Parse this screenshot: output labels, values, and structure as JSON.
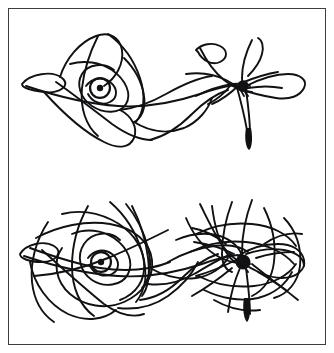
{
  "figure": {
    "title": "",
    "caption": "",
    "background_color": "#ffffff",
    "ink_color": "#111114",
    "frame": {
      "label": "figure-border",
      "color": "#3c3c42",
      "stroke_width": 1,
      "x": 8,
      "y": 8,
      "width": 318,
      "height": 337
    },
    "panels": [
      {
        "id": "upper-panel",
        "label": "upper trajectory plot",
        "iterations_note": "short orbit",
        "elliptic_center": {
          "x": 100,
          "y": 88,
          "radius": 3.2,
          "label": "elliptic fixed point (left)"
        },
        "hyperbolic_center": {
          "x": 243,
          "y": 86,
          "radius": 5.8,
          "label": "hyperbolic fixed point (right)"
        },
        "tail": {
          "x": 249,
          "y": 148,
          "label": "lower cusp tail"
        }
      },
      {
        "id": "lower-panel",
        "label": "lower trajectory plot",
        "iterations_note": "long orbit",
        "elliptic_center": {
          "x": 101,
          "y": 262,
          "radius": 3.2,
          "label": "elliptic fixed point (left)"
        },
        "hyperbolic_center": {
          "x": 243,
          "y": 262,
          "radius": 7.5,
          "label": "hyperbolic fixed point (right)"
        },
        "tail": {
          "x": 247,
          "y": 320,
          "label": "lower cusp tail"
        }
      }
    ]
  },
  "chart_data": {
    "type": "line",
    "title": "",
    "subtitle": "",
    "xlabel": "",
    "ylabel": "",
    "grid": false,
    "legend": "none",
    "axes_visible": false,
    "tick_labels_x": [],
    "tick_labels_y": [],
    "annotations": [],
    "series": [
      {
        "name": "upper-orbit",
        "panel": "upper-panel",
        "stroke": "#111114",
        "stroke_width": 1.9,
        "paths": [
          "M 22 84 C 30 74, 52 70, 62 78 C 72 86, 58 94, 44 92 C 30 90, 22 88, 22 84 Z",
          "M 26 86 C 56 96, 88 104, 118 106 C 150 108, 176 102, 200 94 C 214 89, 226 86, 236 85",
          "M 44 92 C 62 112, 84 132, 104 142 C 120 150, 130 147, 134 138 C 138 128, 132 116, 120 110",
          "M 60 77 C 66 58, 80 42, 96 36 C 110 31, 120 38, 122 50 C 124 64, 116 78, 104 86",
          "M 98 36 C 90 52, 84 70, 82 88 C 80 108, 86 126, 98 136",
          "M 108 34 C 122 44, 134 60, 140 78 C 146 96, 144 112, 136 122",
          "M 70 64 C 84 60, 100 62, 112 70 C 126 80, 132 94, 126 104 C 120 114, 104 114, 92 106 C 80 98, 76 84, 82 74 C 88 64, 104 62, 114 70",
          "M 86 86 C 92 78, 102 76, 110 82 C 118 88, 118 98, 110 102 C 102 106, 92 102, 88 94",
          "M 56 82 C 76 96, 96 112, 112 124 C 126 134, 140 140, 152 140",
          "M 124 58 C 134 68, 142 82, 144 96 C 146 108, 142 118, 134 122",
          "M 134 122 C 150 132, 168 134, 184 128 C 198 122, 208 110, 212 98",
          "M 120 110 C 136 108, 152 102, 166 94 C 182 85, 198 78, 212 76",
          "M 150 140 C 166 136, 180 126, 192 114 C 204 102, 216 94, 228 90",
          "M 196 96 C 208 90, 220 86, 232 84 C 240 83, 246 84, 250 86",
          "M 186 74 C 200 72, 214 74, 226 80 C 236 85, 242 90, 244 96",
          "M 200 48 C 206 60, 214 72, 224 80 C 234 88, 244 92, 252 92",
          "M 196 50 C 202 44, 212 42, 220 46 C 228 50, 228 58, 220 62 C 212 66, 202 60, 198 52 Z",
          "M 236 88 C 248 92, 262 96, 276 98 C 290 100, 300 96, 304 88 C 308 80, 300 74, 288 74 C 274 74, 258 80, 246 86",
          "M 252 40 C 246 52, 242 66, 242 78 C 242 86, 244 92, 248 96",
          "M 258 38 C 262 40, 264 46, 262 54 C 260 62, 254 70, 248 76",
          "M 240 84 C 232 92, 222 100, 212 104",
          "M 246 90 C 248 104, 250 120, 250 134",
          "M 236 84 C 240 98, 244 114, 247 130",
          "M 230 86 C 224 94, 216 100, 208 104",
          "M 244 82 C 254 78, 266 74, 278 72",
          "M 248 88 C 260 86, 272 86, 282 88"
        ],
        "tail_path": "M 246 128 C 244 138, 246 148, 249 150 C 252 148, 253 138, 251 128 Z"
      },
      {
        "name": "lower-orbit",
        "panel": "lower-panel",
        "stroke": "#111114",
        "stroke_width": 1.9,
        "paths": [
          "M 20 254 C 26 244, 44 240, 54 246 C 64 252, 56 262, 42 262 C 28 262, 20 258, 20 254 Z",
          "M 24 256 C 54 266, 86 274, 118 276 C 150 278, 178 272, 202 264 C 216 259, 228 256, 238 255",
          "M 36 238 C 58 226, 86 220, 110 224 C 134 228, 150 242, 152 260 C 154 278, 142 294, 124 302 C 106 310, 84 306, 70 294 C 56 282, 52 262, 62 248",
          "M 30 262 C 34 284, 48 304, 68 314 C 86 322, 104 320, 116 310",
          "M 48 222 C 36 240, 30 262, 32 282 C 34 300, 42 314, 54 322",
          "M 62 214 C 78 210, 96 212, 112 220 C 130 229, 142 244, 144 262 C 146 280, 136 294, 120 300",
          "M 88 206 C 78 224, 72 246, 72 266 C 72 288, 80 306, 94 316",
          "M 110 202 C 124 214, 136 232, 142 252 C 148 272, 146 290, 136 302",
          "M 72 234 C 86 228, 102 230, 114 238 C 128 248, 134 262, 128 274 C 122 286, 104 288, 92 280 C 80 272, 76 256, 84 244 C 92 232, 110 230, 120 240",
          "M 88 258 C 94 250, 104 248, 112 254 C 120 260, 120 270, 112 274 C 104 278, 94 274, 90 266",
          "M 42 250 C 62 268, 84 288, 104 304 C 118 314, 132 318, 144 314",
          "M 126 204 C 136 216, 144 232, 148 248 C 152 264, 150 278, 142 288",
          "M 132 206 C 140 222, 146 240, 148 258 C 150 274, 148 288, 142 296",
          "M 30 248 C 52 256, 76 264, 100 268 C 126 272, 150 270, 170 262",
          "M 34 276 C 58 274, 84 268, 108 258 C 132 248, 152 238, 168 230",
          "M 140 300 C 156 298, 170 290, 182 278 C 194 266, 206 258, 218 254",
          "M 118 308 C 136 310, 154 306, 168 296 C 182 286, 192 274, 198 262",
          "M 150 268 C 164 276, 180 280, 196 278 C 210 276, 222 268, 228 258",
          "M 148 284 C 164 286, 180 282, 194 274 C 208 266, 220 258, 232 254",
          "M 168 262 C 182 254, 198 248, 214 246 C 228 244, 240 246, 248 252",
          "M 176 240 C 190 234, 206 232, 220 236 C 232 240, 240 248, 242 256",
          "M 186 218 C 192 232, 202 246, 214 254 C 226 262, 238 264, 248 262",
          "M 200 204 C 208 220, 216 238, 226 250 C 234 260, 242 264, 250 264",
          "M 212 206 C 214 222, 218 240, 226 252 C 232 262, 240 266, 248 266",
          "M 232 202 C 226 218, 222 238, 222 254 C 222 264, 226 270, 232 272",
          "M 252 200 C 246 216, 242 236, 242 252 C 242 262, 244 268, 248 272",
          "M 264 208 C 272 224, 276 244, 274 262 C 272 278, 264 290, 252 296",
          "M 284 218 C 296 230, 302 248, 300 266 C 298 282, 288 294, 274 298",
          "M 196 234 C 212 226, 232 222, 252 224 C 272 226, 288 234, 296 246",
          "M 190 252 C 206 244, 226 240, 246 242 C 266 244, 284 252, 294 264",
          "M 198 276 C 214 284, 234 288, 254 286 C 272 284, 288 276, 296 264",
          "M 204 290 C 220 298, 240 302, 258 298 C 274 294, 286 284, 292 272",
          "M 238 256 C 250 248, 264 244, 278 244 C 292 244, 302 250, 304 260 C 306 270, 296 278, 282 278 C 268 278, 252 270, 242 262",
          "M 246 254 C 258 250, 272 248, 284 250 C 296 252, 304 258, 304 266",
          "M 236 260 C 224 266, 210 272, 196 276",
          "M 240 268 C 234 282, 230 298, 228 312",
          "M 246 268 C 248 284, 250 300, 250 314",
          "M 252 264 C 262 272, 274 282, 286 290",
          "M 234 254 C 222 248, 208 244, 194 242",
          "M 232 268 C 220 278, 206 288, 192 296",
          "M 256 258 C 268 254, 282 252, 294 252",
          "M 226 244 C 216 236, 204 230, 192 228",
          "M 258 272 C 272 280, 286 290, 298 300",
          "M 214 300 C 228 308, 244 312, 260 310",
          "M 264 244 C 276 236, 290 232, 302 234"
        ],
        "tail_path": "M 244 298 C 242 308, 244 320, 247 322 C 250 320, 251 308, 249 298 Z"
      }
    ]
  }
}
